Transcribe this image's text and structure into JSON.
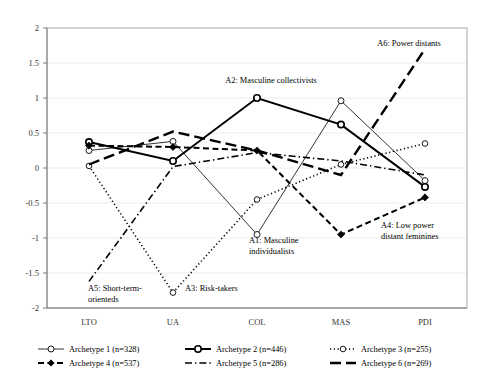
{
  "chart_data": {
    "type": "line",
    "title": "",
    "subtitle": "",
    "xlabel": "",
    "ylabel": "",
    "categories": [
      "LTO",
      "UA",
      "COL",
      "MAS",
      "PDI"
    ],
    "ylim": [
      -2,
      2
    ],
    "yticks": [
      "-2",
      "-1.5",
      "-1",
      "-0.5",
      "0",
      "0.5",
      "1",
      "1.5",
      "2"
    ],
    "ytick_values": [
      -2,
      -1.5,
      -1,
      -0.5,
      0,
      0.5,
      1,
      1.5,
      2
    ],
    "grid": "horizontal",
    "legend_position": "bottom",
    "series": [
      {
        "name": "Archetype 1 (n=328)",
        "short": "Archetype 1",
        "n": 328,
        "style": "thin-solid-open-marker",
        "values": [
          0.25,
          0.38,
          -0.95,
          0.96,
          -0.18
        ]
      },
      {
        "name": "Archetype 2 (n=446)",
        "short": "Archetype 2",
        "n": 446,
        "style": "bold-solid-open-marker",
        "values": [
          0.37,
          0.1,
          1.0,
          0.62,
          -0.27
        ]
      },
      {
        "name": "Archetype 3 (n=255)",
        "short": "Archetype 3",
        "n": 255,
        "style": "dotted-open-marker",
        "values": [
          0.03,
          -1.78,
          -0.45,
          0.05,
          0.35
        ]
      },
      {
        "name": "Archetype 4 (n=537)",
        "short": "Archetype 4",
        "n": 537,
        "style": "dashed-filled-diamond",
        "values": [
          0.32,
          0.3,
          0.25,
          -0.95,
          -0.42
        ]
      },
      {
        "name": "Archetype 5 (n=286)",
        "short": "Archetype 5",
        "n": 286,
        "style": "dash-dot",
        "values": [
          -1.62,
          0.02,
          0.22,
          0.1,
          -0.1
        ]
      },
      {
        "name": "Archetype 6 (n=269)",
        "short": "Archetype 6",
        "n": 269,
        "style": "long-dash-bold",
        "values": [
          0.05,
          0.52,
          0.25,
          -0.1,
          1.7
        ]
      }
    ],
    "annotations": [
      {
        "id": "a2",
        "text": "A2: Masculine collectivists",
        "x": 271,
        "y": 83,
        "anchor": "middle",
        "lines": [
          "A2: Masculine collectivists"
        ]
      },
      {
        "id": "a6",
        "text": "A6: Power distants",
        "x": 409,
        "y": 46,
        "anchor": "middle",
        "lines": [
          "A6: Power distants"
        ]
      },
      {
        "id": "a1",
        "text": "A1: Masculine individualists",
        "x": 249,
        "y": 243,
        "anchor": "start",
        "lines": [
          "A1: Masculine",
          "individualists"
        ]
      },
      {
        "id": "a4",
        "text": "A4: Low power distant feminines",
        "x": 381,
        "y": 228,
        "anchor": "start",
        "lines": [
          "A4: Low power",
          "distant feminines"
        ]
      },
      {
        "id": "a5",
        "text": "A5: Short-term-orienteds",
        "x": 88,
        "y": 291,
        "anchor": "start",
        "lines": [
          "A5: Short-term-",
          "orienteds"
        ]
      },
      {
        "id": "a3",
        "text": "A3: Risk-takers",
        "x": 185,
        "y": 291,
        "anchor": "start",
        "lines": [
          "A3: Risk-takers"
        ]
      }
    ],
    "colors": {
      "series": "#000000",
      "grid": "#e8e8e8",
      "axis": "#7f7f7f",
      "border": "#a6a6a6",
      "text": "#000000",
      "background": "#ffffff"
    }
  }
}
